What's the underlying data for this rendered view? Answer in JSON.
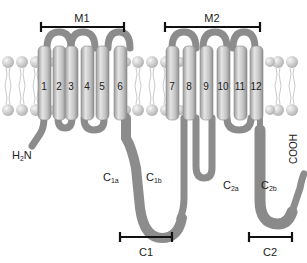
{
  "diagram": {
    "type": "membrane-protein-topology",
    "colors": {
      "helix": "#c8c8c8",
      "helix_highlight": "#e6e6e6",
      "helix_shadow": "#9a9a9a",
      "loop": "#8a8a8a",
      "cytoplasmic_loop": "#8c8c8c",
      "lipid_head": "#d8d8d8",
      "lipid_tail": "#bdbdbd",
      "bar": "#111111",
      "text": "#222222"
    },
    "domains": {
      "M1": {
        "label": "M1",
        "helices": [
          "1",
          "2",
          "3",
          "4",
          "5",
          "6"
        ]
      },
      "M2": {
        "label": "M2",
        "helices": [
          "7",
          "8",
          "9",
          "10",
          "11",
          "12"
        ]
      },
      "C1": {
        "label": "C1",
        "subregions": [
          "C1a",
          "C1b"
        ]
      },
      "C2": {
        "label": "C2",
        "subregions": [
          "C2a",
          "C2b"
        ]
      }
    },
    "helix_labels": [
      "1",
      "2",
      "3",
      "4",
      "5",
      "6",
      "7",
      "8",
      "9",
      "10",
      "11",
      "12"
    ],
    "termini": {
      "n_terminus": {
        "main": "H",
        "sub": "2",
        "tail": "N"
      },
      "c_terminus": "COOH"
    },
    "subregion_labels": {
      "c1a": {
        "main": "C",
        "sub": "1a"
      },
      "c1b": {
        "main": "C",
        "sub": "1b"
      },
      "c2a": {
        "main": "C",
        "sub": "2a"
      },
      "c2b": {
        "main": "C",
        "sub": "2b"
      }
    }
  }
}
